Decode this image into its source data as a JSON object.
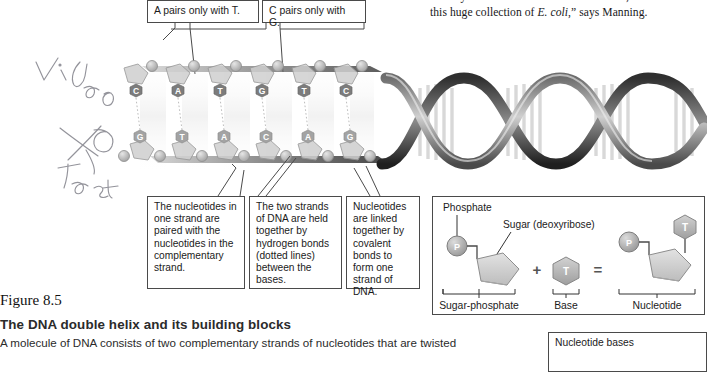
{
  "page": {
    "column_text_line1": "steadily filled the lab. “Before we knew it, we had",
    "column_text_line2_pre": "this huge collection of ",
    "column_text_line2_em": "E. coli",
    "column_text_line2_post": ",” says Manning."
  },
  "handwriting": {
    "word1": "Video",
    "word2": "Test",
    "mark": "scribble-x"
  },
  "top_callouts": [
    {
      "id": "a-pairs",
      "text": "A pairs only with T."
    },
    {
      "id": "c-pairs",
      "text": "C pairs only with G."
    }
  ],
  "bottom_callouts": [
    {
      "id": "complementary-pairing",
      "text": "The nucleotides in one strand are paired with the nucleotides in the complementary strand."
    },
    {
      "id": "hydrogen-bonds",
      "text": "The two strands of DNA are held together by hydrogen bonds (dotted lines) between the bases."
    },
    {
      "id": "covalent-bonds",
      "text": "Nucleotides are linked together by covalent bonds to form one strand of DNA."
    }
  ],
  "dna_ladder": {
    "base_pairs": [
      {
        "top": "C",
        "bottom": "G"
      },
      {
        "top": "A",
        "bottom": "T"
      },
      {
        "top": "T",
        "bottom": "A"
      },
      {
        "top": "G",
        "bottom": "C"
      },
      {
        "top": "T",
        "bottom": "A"
      },
      {
        "top": "C",
        "bottom": "G"
      },
      {
        "top": "G",
        "bottom": "C"
      }
    ]
  },
  "building_blocks": {
    "phosphate_label": "Phosphate",
    "sugar_label": "Sugar (deoxyribose)",
    "phosphate_symbol": "P",
    "base_symbol": "T",
    "plus": "+",
    "equals": "=",
    "bracket_labels": [
      "Sugar-phosphate",
      "Base",
      "Nucleotide"
    ]
  },
  "nucleotide_bases_box": {
    "title": "Nucleotide bases"
  },
  "caption": {
    "figure_number": "Figure 8.5",
    "title": "The DNA double helix and its building blocks",
    "body": "A molecule of DNA consists of two complementary strands of nucleotides that are twisted"
  },
  "colors": {
    "line": "#4a4a4a",
    "text": "#1b1b1b",
    "helix_dark": "#3a3a3a",
    "helix_light": "#b8b8b8",
    "base_fill": "#8e8e8e",
    "sugar_fill": "#c9c9c9"
  }
}
